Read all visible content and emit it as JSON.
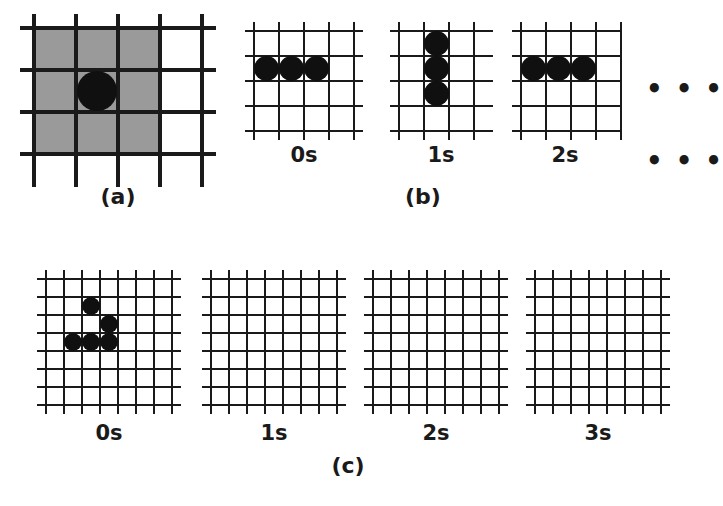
{
  "figure": {
    "background_color": "#ffffff",
    "line_color": "#1a1a1a",
    "cell_color": "#101010",
    "shade_color": "#9a9a9a"
  },
  "panels": {
    "a": {
      "label": "(a)",
      "description": "Moore neighbourhood: shaded 3x3 region surrounding a single live cell",
      "grid": {
        "cols": 4,
        "rows": 4
      },
      "shaded_region": {
        "x0": 0,
        "y0": 0,
        "x1": 3,
        "y1": 3
      },
      "cells": [
        {
          "col": 1,
          "row": 1
        }
      ]
    },
    "b": {
      "label": "(b)",
      "description": "Blinker oscillator alternating between horizontal and vertical",
      "ellipsis_right": "• • •",
      "ellipsis_bottom": "• • •",
      "frames": [
        {
          "time_label": "0s",
          "grid": {
            "cols": 4,
            "rows": 4
          },
          "cells": [
            {
              "col": 0,
              "row": 1
            },
            {
              "col": 1,
              "row": 1
            },
            {
              "col": 2,
              "row": 1
            }
          ]
        },
        {
          "time_label": "1s",
          "grid": {
            "cols": 4,
            "rows": 4
          },
          "cells": [
            {
              "col": 1,
              "row": 0
            },
            {
              "col": 1,
              "row": 1
            },
            {
              "col": 1,
              "row": 2
            }
          ]
        },
        {
          "time_label": "2s",
          "grid": {
            "cols": 4,
            "rows": 4
          },
          "cells": [
            {
              "col": 0,
              "row": 1
            },
            {
              "col": 1,
              "row": 1
            },
            {
              "col": 2,
              "row": 1
            }
          ]
        }
      ]
    },
    "c": {
      "label": "(c)",
      "description": "Pattern that dies out after one generation",
      "frames": [
        {
          "time_label": "0s",
          "grid": {
            "cols": 7,
            "rows": 7
          },
          "cells": [
            {
              "col": 2,
              "row": 1
            },
            {
              "col": 3,
              "row": 2
            },
            {
              "col": 1,
              "row": 3
            },
            {
              "col": 2,
              "row": 3
            },
            {
              "col": 3,
              "row": 3
            }
          ]
        },
        {
          "time_label": "1s",
          "grid": {
            "cols": 7,
            "rows": 7
          },
          "cells": []
        },
        {
          "time_label": "2s",
          "grid": {
            "cols": 7,
            "rows": 7
          },
          "cells": []
        },
        {
          "time_label": "3s",
          "grid": {
            "cols": 7,
            "rows": 7
          },
          "cells": []
        }
      ]
    }
  }
}
